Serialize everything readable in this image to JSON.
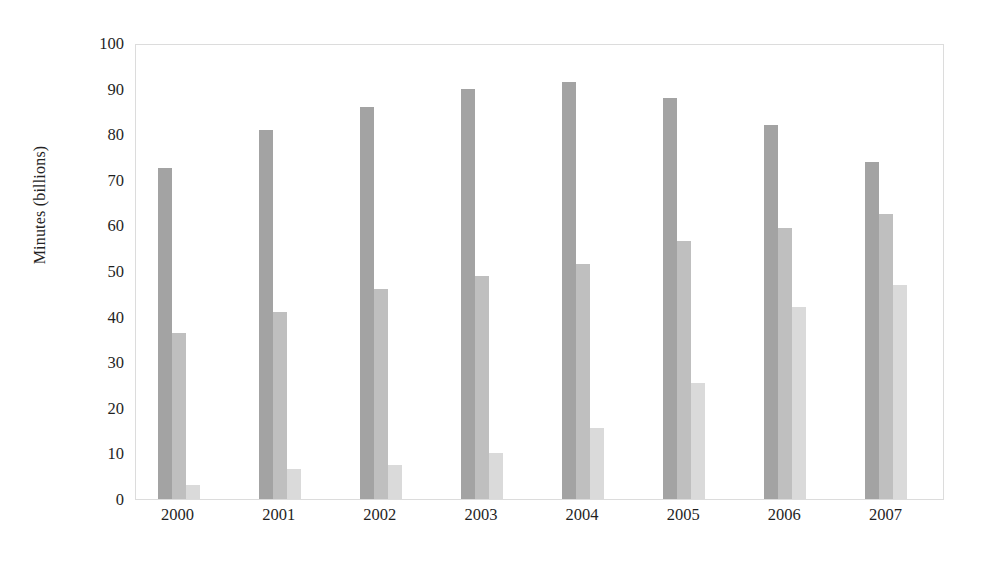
{
  "chart_data": {
    "type": "bar",
    "title": "",
    "xlabel": "",
    "ylabel": "Minutes (billions)",
    "categories": [
      "2000",
      "2001",
      "2002",
      "2003",
      "2004",
      "2005",
      "2006",
      "2007"
    ],
    "series": [
      {
        "name": "series-1",
        "color": "#a3a3a3",
        "values": [
          72.5,
          81,
          86,
          90,
          91.5,
          88,
          82,
          74
        ]
      },
      {
        "name": "series-2",
        "color": "#bfbfbf",
        "values": [
          36.5,
          41,
          46,
          49,
          51.5,
          56.5,
          59.5,
          62.5
        ]
      },
      {
        "name": "series-3",
        "color": "#dadada",
        "values": [
          3,
          6.5,
          7.5,
          10,
          15.5,
          25.5,
          42,
          47
        ]
      }
    ],
    "ylim": [
      0,
      100
    ],
    "yticks": [
      0,
      10,
      20,
      30,
      40,
      50,
      60,
      70,
      80,
      90,
      100
    ],
    "ytick_labels": [
      "0",
      "10",
      "20",
      "30",
      "40",
      "50",
      "60",
      "70",
      "80",
      "90",
      "100"
    ],
    "grid": false,
    "legend": "none",
    "frame": true,
    "frame_color": "#dcdcdc",
    "background": "#ffffff"
  }
}
